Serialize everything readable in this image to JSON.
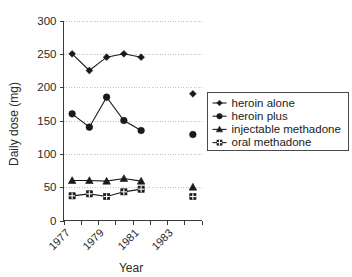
{
  "chart_data": {
    "type": "line",
    "title": "",
    "xlabel": "Year",
    "ylabel": "Daily dose (mg)",
    "xlim": [
      1977,
      1985
    ],
    "ylim": [
      0,
      300
    ],
    "yticks": [
      0,
      50,
      100,
      150,
      200,
      250,
      300
    ],
    "ytick_labels": [
      "0",
      "50",
      "100",
      "150",
      "200",
      "250",
      "300"
    ],
    "xticks": [
      1977,
      1978,
      1979,
      1980,
      1981,
      1982,
      1983,
      1984,
      1985
    ],
    "xtick_labels": [
      "1977",
      "",
      "1979",
      "",
      "1981",
      "",
      "1983",
      "",
      ""
    ],
    "xtick_labels_shown": [
      "1977",
      "1979",
      "1981",
      "1983"
    ],
    "grid": "horizontal-dotted",
    "legend_position": "right",
    "series": [
      {
        "name": "heroin alone",
        "marker": "diamond",
        "x": [
          1977.5,
          1978.5,
          1979.5,
          1980.5,
          1981.5
        ],
        "values": [
          250,
          225,
          245,
          250,
          245
        ],
        "extra_points": [
          {
            "x": 1984.5,
            "y": 190
          }
        ]
      },
      {
        "name": "heroin plus",
        "marker": "circle",
        "x": [
          1977.5,
          1978.5,
          1979.5,
          1980.5,
          1981.5
        ],
        "values": [
          160,
          140,
          185,
          150,
          135
        ],
        "extra_points": [
          {
            "x": 1984.5,
            "y": 129
          }
        ]
      },
      {
        "name": "injectable methadone",
        "marker": "triangle",
        "x": [
          1977.5,
          1978.5,
          1979.5,
          1980.5,
          1981.5
        ],
        "values": [
          60,
          60,
          59,
          63,
          59
        ],
        "extra_points": [
          {
            "x": 1984.5,
            "y": 50
          }
        ]
      },
      {
        "name": "oral methadone",
        "marker": "square",
        "x": [
          1977.5,
          1978.5,
          1979.5,
          1980.5,
          1981.5
        ],
        "values": [
          37,
          40,
          36,
          43,
          47
        ],
        "extra_points": [
          {
            "x": 1984.5,
            "y": 36
          }
        ]
      }
    ],
    "colors": {
      "series": "#1a1a1a",
      "grid": "#bdbdbd",
      "axis": "#3a3a3a",
      "background": "#ffffff"
    }
  },
  "legend": {
    "items": [
      {
        "label": "heroin alone",
        "marker": "diamond"
      },
      {
        "label": "heroin plus",
        "marker": "circle"
      },
      {
        "label": "injectable methadone",
        "marker": "triangle"
      },
      {
        "label": "oral methadone",
        "marker": "square"
      }
    ]
  }
}
